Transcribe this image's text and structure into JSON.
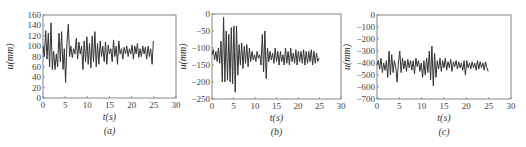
{
  "chart_data": [
    {
      "type": "line",
      "title": "",
      "caption": "(a)",
      "xlabel": "t(s)",
      "ylabel": "u(mm)",
      "xlim": [
        0,
        30
      ],
      "ylim": [
        0,
        160
      ],
      "xticks": [
        0,
        5,
        10,
        15,
        20,
        25,
        30
      ],
      "yticks": [
        0,
        20,
        40,
        60,
        80,
        100,
        120,
        140,
        160
      ],
      "grid": false,
      "color": "#333333",
      "x": [
        0,
        0.3,
        0.6,
        0.9,
        1.2,
        1.5,
        1.8,
        2.1,
        2.4,
        2.7,
        3.0,
        3.3,
        3.6,
        3.9,
        4.2,
        4.5,
        4.8,
        5.1,
        5.4,
        5.7,
        6.0,
        6.3,
        6.6,
        6.9,
        7.2,
        7.5,
        7.8,
        8.1,
        8.4,
        8.7,
        9.0,
        9.3,
        9.6,
        9.9,
        10.2,
        10.5,
        10.8,
        11.1,
        11.4,
        11.7,
        12.0,
        12.3,
        12.6,
        12.9,
        13.2,
        13.5,
        13.8,
        14.1,
        14.4,
        14.7,
        15.0,
        15.3,
        15.6,
        15.9,
        16.2,
        16.5,
        16.8,
        17.1,
        17.4,
        17.7,
        18.0,
        18.3,
        18.6,
        18.9,
        19.2,
        19.5,
        19.8,
        20.1,
        20.4,
        20.7,
        21.0,
        21.3,
        21.6,
        21.9,
        22.2,
        22.5,
        22.8,
        23.1,
        23.4,
        23.7,
        24.0,
        24.3,
        24.6,
        24.9
      ],
      "values": [
        100,
        80,
        130,
        75,
        125,
        60,
        145,
        55,
        90,
        55,
        85,
        60,
        125,
        70,
        128,
        55,
        95,
        30,
        105,
        142,
        80,
        100,
        78,
        95,
        85,
        115,
        75,
        108,
        85,
        100,
        55,
        110,
        70,
        118,
        65,
        105,
        58,
        120,
        70,
        128,
        60,
        105,
        65,
        110,
        80,
        100,
        70,
        108,
        65,
        102,
        85,
        95,
        70,
        112,
        80,
        100,
        65,
        110,
        85,
        95,
        75,
        98,
        85,
        100,
        80,
        95,
        85,
        102,
        75,
        100,
        85,
        105,
        78,
        95,
        80,
        100,
        85,
        98,
        75,
        100,
        80,
        95,
        65,
        110
      ],
      "series": [
        {
          "name": "u(t) (a)"
        }
      ]
    },
    {
      "type": "line",
      "title": "",
      "caption": "(b)",
      "xlabel": "t(s)",
      "ylabel": "u(mm)",
      "xlim": [
        0,
        30
      ],
      "ylim": [
        -250,
        0
      ],
      "xticks": [
        0,
        5,
        10,
        15,
        20,
        25,
        30
      ],
      "yticks": [
        0,
        -50,
        -100,
        -150,
        -200,
        -250
      ],
      "grid": false,
      "color": "#333333",
      "x": [
        0,
        0.3,
        0.6,
        0.9,
        1.2,
        1.5,
        1.8,
        2.1,
        2.4,
        2.7,
        3.0,
        3.3,
        3.6,
        3.9,
        4.2,
        4.5,
        4.8,
        5.1,
        5.4,
        5.7,
        6.0,
        6.3,
        6.6,
        6.9,
        7.2,
        7.5,
        7.8,
        8.1,
        8.4,
        8.7,
        9.0,
        9.3,
        9.6,
        9.9,
        10.2,
        10.5,
        10.8,
        11.1,
        11.4,
        11.7,
        12.0,
        12.3,
        12.6,
        12.9,
        13.2,
        13.5,
        13.8,
        14.1,
        14.4,
        14.7,
        15.0,
        15.3,
        15.6,
        15.9,
        16.2,
        16.5,
        16.8,
        17.1,
        17.4,
        17.7,
        18.0,
        18.3,
        18.6,
        18.9,
        19.2,
        19.5,
        19.8,
        20.1,
        20.4,
        20.7,
        21.0,
        21.3,
        21.6,
        21.9,
        22.2,
        22.5,
        22.8,
        23.1,
        23.4,
        23.7,
        24.0,
        24.3,
        24.6,
        24.9
      ],
      "values": [
        -120,
        -105,
        -135,
        -110,
        -140,
        -100,
        -145,
        -80,
        -200,
        -10,
        -200,
        -50,
        -195,
        -60,
        -200,
        -40,
        -205,
        -35,
        -230,
        -35,
        -180,
        -90,
        -150,
        -85,
        -160,
        -95,
        -145,
        -90,
        -155,
        -100,
        -140,
        -110,
        -135,
        -120,
        -140,
        -110,
        -130,
        -120,
        -150,
        -60,
        -170,
        -50,
        -190,
        -100,
        -140,
        -110,
        -135,
        -115,
        -145,
        -100,
        -140,
        -110,
        -150,
        -110,
        -140,
        -120,
        -150,
        -100,
        -145,
        -110,
        -150,
        -100,
        -140,
        -115,
        -145,
        -105,
        -150,
        -110,
        -140,
        -110,
        -145,
        -105,
        -150,
        -110,
        -145,
        -110,
        -140,
        -105,
        -150,
        -110,
        -145,
        -115,
        -140,
        -130
      ],
      "series": [
        {
          "name": "u(t) (b)"
        }
      ]
    },
    {
      "type": "line",
      "title": "",
      "caption": "(c)",
      "xlabel": "t(s)",
      "ylabel": "u(mm)",
      "xlim": [
        0,
        30
      ],
      "ylim": [
        -700,
        0
      ],
      "xticks": [
        0,
        5,
        10,
        15,
        20,
        25,
        30
      ],
      "yticks": [
        0,
        -100,
        -200,
        -300,
        -400,
        -500,
        -600,
        -700
      ],
      "grid": false,
      "color": "#333333",
      "x": [
        0,
        0.3,
        0.6,
        0.9,
        1.2,
        1.5,
        1.8,
        2.1,
        2.4,
        2.7,
        3.0,
        3.3,
        3.6,
        3.9,
        4.2,
        4.5,
        4.8,
        5.1,
        5.4,
        5.7,
        6.0,
        6.3,
        6.6,
        6.9,
        7.2,
        7.5,
        7.8,
        8.1,
        8.4,
        8.7,
        9.0,
        9.3,
        9.6,
        9.9,
        10.2,
        10.5,
        10.8,
        11.1,
        11.4,
        11.7,
        12.0,
        12.3,
        12.6,
        12.9,
        13.2,
        13.5,
        13.8,
        14.1,
        14.4,
        14.7,
        15.0,
        15.3,
        15.6,
        15.9,
        16.2,
        16.5,
        16.8,
        17.1,
        17.4,
        17.7,
        18.0,
        18.3,
        18.6,
        18.9,
        19.2,
        19.5,
        19.8,
        20.1,
        20.4,
        20.7,
        21.0,
        21.3,
        21.6,
        21.9,
        22.2,
        22.5,
        22.8,
        23.1,
        23.4,
        23.7,
        24.0,
        24.3,
        24.6,
        24.9
      ],
      "values": [
        -420,
        -380,
        -450,
        -360,
        -480,
        -400,
        -460,
        -380,
        -520,
        -300,
        -500,
        -330,
        -480,
        -380,
        -440,
        -560,
        -400,
        -300,
        -480,
        -360,
        -450,
        -380,
        -470,
        -370,
        -440,
        -380,
        -460,
        -380,
        -490,
        -360,
        -430,
        -380,
        -470,
        -400,
        -520,
        -380,
        -500,
        -360,
        -480,
        -300,
        -540,
        -260,
        -590,
        -320,
        -520,
        -380,
        -450,
        -360,
        -470,
        -380,
        -440,
        -360,
        -460,
        -390,
        -440,
        -370,
        -470,
        -390,
        -430,
        -380,
        -450,
        -390,
        -440,
        -400,
        -460,
        -380,
        -500,
        -380,
        -440,
        -400,
        -450,
        -390,
        -440,
        -400,
        -460,
        -380,
        -450,
        -390,
        -440,
        -400,
        -460,
        -390,
        -440,
        -470
      ],
      "series": [
        {
          "name": "u(t) (c)"
        }
      ]
    }
  ]
}
